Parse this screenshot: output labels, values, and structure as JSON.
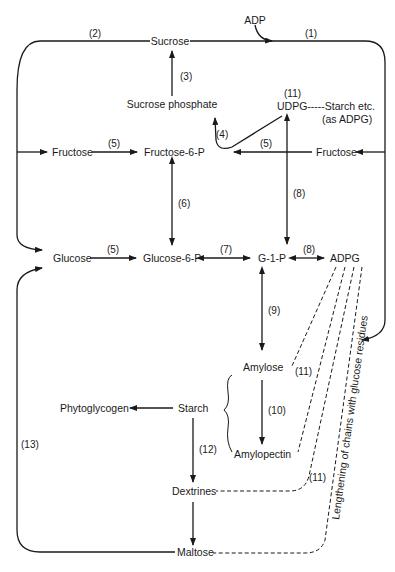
{
  "diagram": {
    "nodes": {
      "adp": "ADP",
      "sucrose": "Sucrose",
      "sucrose_phosphate": "Sucrose phosphate",
      "udpg": "UDPG-----Starch etc.",
      "udpg_note": "(as ADPG)",
      "fructose_left": "Fructose",
      "fructose_6p": "Fructose-6-P",
      "fructose_right": "Fructose",
      "glucose": "Glucose",
      "glucose_6p": "Glucose-6-P",
      "g1p": "G-1-P",
      "adpg": "ADPG",
      "amylose": "Amylose",
      "amylopectin": "Amylopectin",
      "starch": "Starch",
      "phytoglycogen": "Phytoglycogen",
      "dextrines": "Dextrines",
      "maltose": "Maltose"
    },
    "edge_labels": {
      "e1": "(1)",
      "e2": "(2)",
      "e3": "(3)",
      "e4": "(4)",
      "e5a": "(5)",
      "e5b": "(5)",
      "e5c": "(5)",
      "e6": "(6)",
      "e7": "(7)",
      "e8a": "(8)",
      "e8b": "(8)",
      "e9": "(9)",
      "e10": "(10)",
      "e11a": "(11)",
      "e11b": "(11)",
      "e11c": "(11)",
      "e12": "(12)",
      "e13": "(13)"
    },
    "annotation": "Lengthening of chains with glucose residues"
  }
}
